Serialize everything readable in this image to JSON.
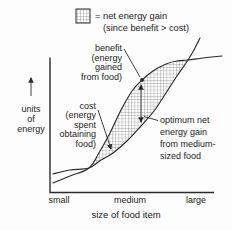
{
  "figure": {
    "colors": {
      "paper": "#fdfdfd",
      "ink": "#2b2b2b",
      "text": "#1c1c1c",
      "hatch": "#9a9a9a"
    }
  },
  "legend": {
    "swatch": "crosshatch-pattern",
    "line1": "= net energy gain",
    "line2": "(since benefit > cost)"
  },
  "y_axis": {
    "label_lines": [
      "units",
      "of",
      "energy"
    ]
  },
  "annotations": {
    "benefit": {
      "lines": [
        "benefit",
        "(energy",
        "gained",
        "from food)"
      ]
    },
    "cost": {
      "lines": [
        "cost",
        "(energy",
        "spent",
        "obtaining",
        "food)"
      ]
    },
    "optimum": {
      "lines": [
        "optimum net",
        "energy gain",
        "from medium-",
        "sized food"
      ]
    }
  },
  "chart_data": {
    "type": "line",
    "title": "",
    "xlabel": "size of food item",
    "ylabel": "units of energy",
    "x_tick_labels": [
      "small",
      "medium",
      "large"
    ],
    "grid": false,
    "legend_position": "top",
    "coords": "svg pixels, y increases downward",
    "series": [
      {
        "name": "benefit (energy gained from food)",
        "points": [
          [
            53,
            183
          ],
          [
            70,
            176
          ],
          [
            89,
            168
          ],
          [
            100,
            151
          ],
          [
            110,
            133
          ],
          [
            121,
            110
          ],
          [
            132,
            91
          ],
          [
            142,
            80
          ],
          [
            153,
            71
          ],
          [
            166,
            64
          ],
          [
            177,
            61
          ],
          [
            188,
            60
          ],
          [
            203,
            58
          ],
          [
            222,
            56
          ]
        ]
      },
      {
        "name": "cost (energy spent obtaining food)",
        "points": [
          [
            53,
            174
          ],
          [
            70,
            170
          ],
          [
            89,
            168
          ],
          [
            101,
            160
          ],
          [
            113,
            153
          ],
          [
            127,
            141
          ],
          [
            141,
            126
          ],
          [
            154,
            111
          ],
          [
            166,
            93
          ],
          [
            177,
            76
          ],
          [
            188,
            60
          ],
          [
            196,
            46
          ],
          [
            200,
            38
          ]
        ]
      }
    ],
    "shaded_region": {
      "meaning": "net energy gain (since benefit > cost)",
      "fill": "crosshatch",
      "benefit_slice": [
        2,
        12
      ],
      "cost_slice": [
        2,
        11
      ]
    },
    "optimum_marker": {
      "x": 141,
      "top_y": 80,
      "bottom_y": 126,
      "at_tick": "medium"
    }
  }
}
